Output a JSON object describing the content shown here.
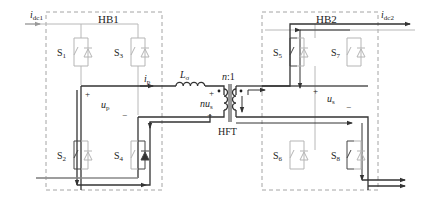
{
  "diagram": {
    "type": "dual-active-bridge-circuit",
    "blocks": [
      {
        "id": "hb1",
        "label": "HB1"
      },
      {
        "id": "hb2",
        "label": "HB2"
      }
    ],
    "currents": {
      "idc1": {
        "main": "i",
        "sub": "dc1"
      },
      "idc2": {
        "main": "i",
        "sub": "dc2"
      },
      "ip": {
        "main": "i",
        "sub": "p"
      }
    },
    "voltages": {
      "up": {
        "main": "u",
        "sub": "p",
        "plus": "+",
        "minus": "−"
      },
      "us": {
        "main": "u",
        "sub": "s",
        "plus": "+",
        "minus": "−"
      },
      "nus": {
        "main": "nu",
        "sub": "s",
        "plus": "+",
        "minus": "−"
      }
    },
    "inductor": {
      "main": "L",
      "sub": "σ"
    },
    "transformer": {
      "ratio": "n:1",
      "label": "HFT"
    },
    "switches": [
      {
        "main": "S",
        "sub": "1",
        "state": "off"
      },
      {
        "main": "S",
        "sub": "3",
        "state": "off"
      },
      {
        "main": "S",
        "sub": "2",
        "state": "on"
      },
      {
        "main": "S",
        "sub": "4",
        "state": "on-diode"
      },
      {
        "main": "S",
        "sub": "5",
        "state": "on"
      },
      {
        "main": "S",
        "sub": "7",
        "state": "off"
      },
      {
        "main": "S",
        "sub": "6",
        "state": "off"
      },
      {
        "main": "S",
        "sub": "8",
        "state": "on"
      }
    ],
    "colors": {
      "active_path": "#333333",
      "inactive_wire": "#b8b8b8",
      "dashed_box": "#9a9a9a"
    }
  }
}
